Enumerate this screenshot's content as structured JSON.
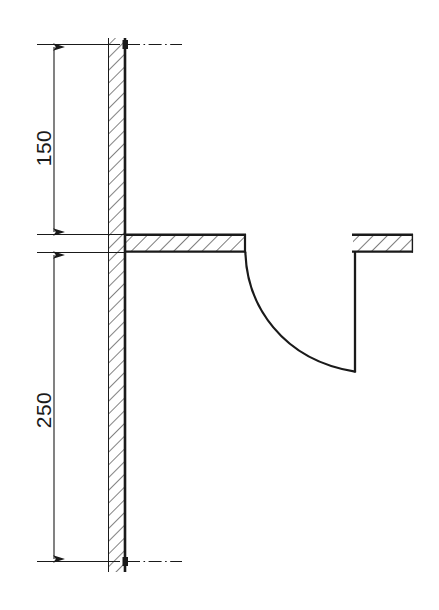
{
  "drawing": {
    "type": "engineering-section-drawing",
    "title": "",
    "background_color": "#ffffff",
    "line_color": "#1a1a1a",
    "hatch_color": "#1a1a1a",
    "dimensions": [
      {
        "id": "dim-150",
        "label": "150",
        "orientation": "vertical",
        "text_rotation_deg": -90,
        "arrow_style": "both-ends",
        "from_y": 44,
        "to_y": 234,
        "text_x": 45,
        "text_y": 148
      },
      {
        "id": "dim-250",
        "label": "250",
        "orientation": "vertical",
        "text_rotation_deg": -90,
        "arrow_style": "both-ends",
        "from_y": 252,
        "to_y": 561,
        "text_x": 45,
        "text_y": 410
      }
    ],
    "elements": {
      "wall": {
        "name": "vertical-wall-section",
        "hatched": true,
        "x_left": 108,
        "x_right": 125,
        "y_top": 38,
        "y_bottom": 572
      },
      "left_slab": {
        "name": "left-horizontal-slab",
        "hatched": true,
        "x_left": 125,
        "x_right": 245,
        "y_top": 234,
        "y_bottom": 252
      },
      "right_slab": {
        "name": "right-horizontal-slab",
        "hatched": true,
        "x_left": 352,
        "x_right": 412,
        "y_top": 234,
        "y_bottom": 252
      },
      "curve": {
        "name": "concave-fillet-curve",
        "start_x": 245,
        "start_y": 252,
        "end_x": 355,
        "end_y": 372
      },
      "right_drop_line": {
        "name": "right-vertical-drop-line",
        "x": 355,
        "y_top": 252,
        "y_bottom": 372
      },
      "centerlines": [
        {
          "name": "top-centerline",
          "y": 44,
          "x_start": 128,
          "x_end": 182
        },
        {
          "name": "bottom-centerline",
          "y": 561,
          "x_start": 128,
          "x_end": 182
        }
      ]
    },
    "units_note": ""
  }
}
